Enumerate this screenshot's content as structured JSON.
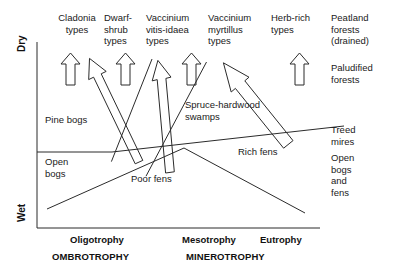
{
  "figure": {
    "type": "conceptual-diagram"
  },
  "axes": {
    "y_top_label": "Dry",
    "y_bottom_label": "Wet",
    "x_ticks": [
      "Oligotrophy",
      "Mesotrophy",
      "Eutrophy"
    ],
    "x_bands": [
      "OMBROTROPHY",
      "MINEROTROPHY"
    ]
  },
  "top_labels": [
    {
      "text": "Cladonia\ntypes"
    },
    {
      "text": "Dwarf-\nshrub\ntypes"
    },
    {
      "text": "Vaccinium\nvitis-idaea\ntypes"
    },
    {
      "text": "Vaccinium\nmyrtillus\ntypes"
    },
    {
      "text": "Herb-rich\ntypes"
    }
  ],
  "right_labels": [
    {
      "text": "Peatland\nforests\n(drained)"
    },
    {
      "text": "Paludified\nforests"
    },
    {
      "text": "Treed\nmires"
    },
    {
      "text": "Open\nbogs\nand\nfens"
    }
  ],
  "field_labels": [
    {
      "text": "Pine bogs"
    },
    {
      "text": "Open\nbogs"
    },
    {
      "text": "Poor fens"
    },
    {
      "text": "Spruce-hardwood\nswamps"
    },
    {
      "text": "Rich fens"
    }
  ],
  "arrows": {
    "vertical_count": 4,
    "diagonal_count": 5,
    "style": "hollow-outline"
  },
  "colors": {
    "line": "#2b2b2b",
    "text": "#1a1a1a",
    "background": "#ffffff"
  }
}
